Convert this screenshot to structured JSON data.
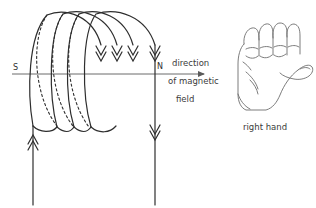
{
  "figure": {
    "stroke_color": "#2e2e2e",
    "axis_color": "#5a5a5a",
    "text_color": "#3b3b3b",
    "background": "#ffffff"
  },
  "labels": {
    "south_pole": "S",
    "north_pole": "N",
    "caption_line1": "direction",
    "caption_line2": "of magnetic",
    "caption_line3": "field",
    "hand_label": "right hand"
  },
  "coil": {
    "solid_loops": 4,
    "dashed_loops": 3,
    "loop_arrow_count": 4,
    "loop_arrow_direction": "down",
    "lead_left_arrow_direction": "up",
    "lead_right_arrow_direction": "down"
  },
  "axis": {
    "direction": "right",
    "arrowhead": "filled-triangle"
  },
  "hand": {
    "type": "right-fist",
    "thumb_direction": "right",
    "curled_fingers": 4
  }
}
